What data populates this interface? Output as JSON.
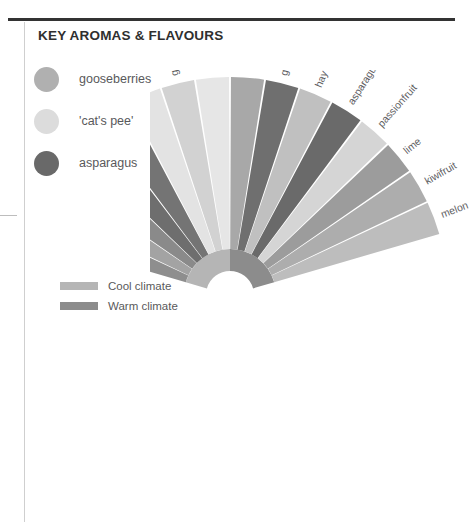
{
  "page": {
    "title": "KEY AROMAS & FLAVOURS",
    "background": "#ffffff",
    "rule_color": "#333333",
    "hairline_color": "#cfcfcf"
  },
  "aroma_legend": {
    "items": [
      {
        "label": "gooseberries",
        "color": "#b0b0b0"
      },
      {
        "label": "'cat's pee'",
        "color": "#dcdcdc"
      },
      {
        "label": "asparagus",
        "color": "#696969"
      }
    ]
  },
  "climate_legend": {
    "items": [
      {
        "label": "Cool climate",
        "color": "#b5b5b5"
      },
      {
        "label": "Warm climate",
        "color": "#8c8c8c"
      }
    ]
  },
  "chart_data": {
    "type": "pie",
    "title": "KEY AROMAS & FLAVOURS",
    "subtype": "radial fan / half-donut of aroma descriptors",
    "legend_position": "left",
    "center": {
      "x": 80,
      "y": 225
    },
    "inner_radius": 46,
    "outer_radius": 218,
    "start_angle_deg": -74,
    "end_angle_deg": 74,
    "arc": {
      "inner_band_radius_start": 24,
      "inner_band_radius_end": 46,
      "cool_color": "#b5b5b5",
      "warm_color": "#8c8c8c",
      "cool_span_deg": 74,
      "warm_span_deg": 74
    },
    "categories": [
      "flint",
      "stone",
      "green apple",
      "nettles",
      "elderflower",
      "lemon",
      "gooseberry",
      "'cat's pee'",
      "orange peel",
      "grass",
      "hay",
      "asparagus",
      "passionfruit",
      "lime",
      "kiwifruit",
      "melon"
    ],
    "values": [
      9.25,
      9.25,
      9.25,
      9.25,
      9.25,
      9.25,
      9.25,
      9.25,
      9.25,
      9.25,
      9.25,
      9.25,
      9.25,
      9.25,
      9.25,
      9.25
    ],
    "unit": "degrees per segment",
    "segment_colors": [
      "#8e8e8e",
      "#a3a3a3",
      "#8a8a8a",
      "#6e6e6e",
      "#747474",
      "#e3e3e3",
      "#d2d2d2",
      "#e6e6e6",
      "#a8a8a8",
      "#6f6f6f",
      "#c0c0c0",
      "#6a6a6a",
      "#d5d5d5",
      "#9c9c9c",
      "#adadad",
      "#bdbdbd"
    ]
  }
}
